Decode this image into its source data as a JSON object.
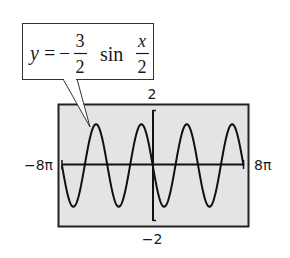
{
  "callout": {
    "lhs": "y",
    "equals": "=",
    "sign": "−",
    "coef_num": "3",
    "coef_den": "2",
    "func": "sin",
    "arg_num": "x",
    "arg_den": "2"
  },
  "window": {
    "xmin_label": "−8π",
    "xmax_label": "8π",
    "ymax_label": "2",
    "ymin_label": "−2"
  },
  "colors": {
    "screen_bg": "#e4e4e4",
    "frame": "#222222",
    "curve": "#111111"
  },
  "chart_data": {
    "type": "line",
    "xlabel": "",
    "ylabel": "",
    "xlim": [
      -25.1327,
      25.1327
    ],
    "ylim": [
      -2,
      2
    ],
    "xlim_labels": [
      "-8π",
      "8π"
    ],
    "ylim_labels": [
      "-2",
      "2"
    ],
    "grid": false,
    "legend": null,
    "series": [
      {
        "name": "y = -3/2 sin(x/2)",
        "amplitude": 1.5,
        "period": "4π",
        "x": [
          "-8π",
          "-7π",
          "-6π",
          "-5π",
          "-4π",
          "-3π",
          "-2π",
          "-π",
          "0",
          "π",
          "2π",
          "3π",
          "4π",
          "5π",
          "6π",
          "7π",
          "8π"
        ],
        "values": [
          0,
          -1.5,
          0,
          1.5,
          0,
          -1.5,
          0,
          1.5,
          0,
          -1.5,
          0,
          1.5,
          0,
          -1.5,
          0,
          1.5,
          0
        ]
      }
    ],
    "annotations": [
      "y = −(3/2) sin(x/2)"
    ]
  }
}
